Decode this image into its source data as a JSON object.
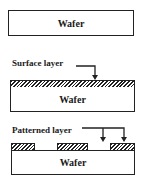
{
  "diagram": {
    "stage1": {
      "wafer_label": "Wafer"
    },
    "stage2": {
      "wafer_label": "Wafer",
      "annotation": "Surface layer"
    },
    "stage3": {
      "wafer_label": "Wafer",
      "annotation": "Patterned layer",
      "pattern_blocks": 3
    }
  },
  "colors": {
    "line": "#222222",
    "background": "#ffffff"
  }
}
